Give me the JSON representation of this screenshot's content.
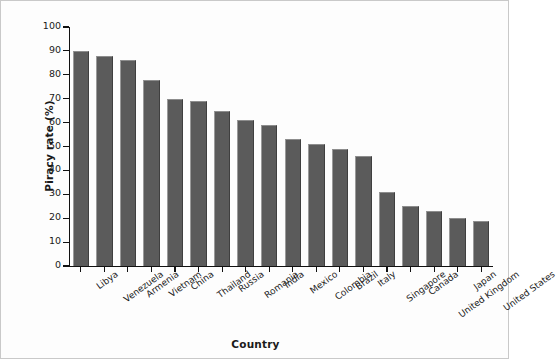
{
  "chart_data": {
    "type": "bar",
    "title": "",
    "xlabel": "Country",
    "ylabel": "Piracy rate (%)",
    "ylim": [
      0,
      100
    ],
    "ytick_values": [
      0,
      10,
      20,
      30,
      40,
      50,
      60,
      70,
      80,
      90,
      100
    ],
    "ytick_labels": [
      "0",
      "10",
      "20",
      "30",
      "40",
      "50",
      "60",
      "70",
      "80",
      "90",
      "100"
    ],
    "grid": false,
    "legend": null,
    "bar_color": "#5b5b5b",
    "categories": [
      "Libya",
      "Venezuela",
      "Armenia",
      "Vietnam",
      "China",
      "Thailand",
      "Russia",
      "Romania",
      "India",
      "Mexico",
      "Colombia",
      "Brazil",
      "Italy",
      "Singapore",
      "Canada",
      "United Kingdom",
      "Japan",
      "United States"
    ],
    "values": [
      90,
      88,
      86,
      78,
      70,
      69,
      65,
      61,
      59,
      53,
      51,
      49,
      46,
      31,
      25,
      23,
      20,
      19
    ]
  }
}
